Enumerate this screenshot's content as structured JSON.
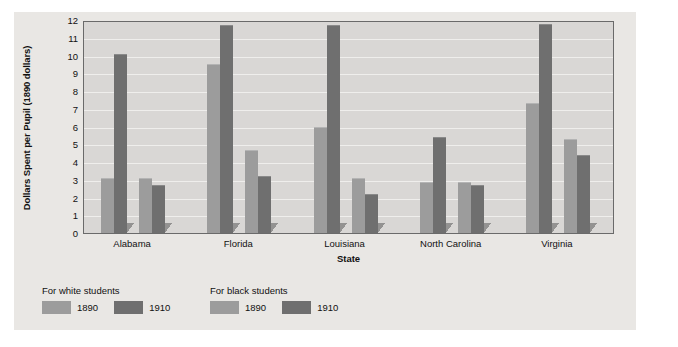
{
  "chart_data": {
    "type": "bar",
    "title": "",
    "xlabel": "State",
    "ylabel": "Dollars Spent per Pupil (1890 dollars)",
    "categories": [
      "Alabama",
      "Florida",
      "Louisiana",
      "North Carolina",
      "Virginia"
    ],
    "ylim": [
      0,
      12
    ],
    "yticks": [
      0,
      1,
      2,
      3,
      4,
      5,
      6,
      7,
      8,
      9,
      10,
      11,
      12
    ],
    "ytick_labels": [
      "0",
      "1",
      "2",
      "3",
      "4",
      "5",
      "6",
      "7",
      "8",
      "9",
      "10",
      "11",
      "12"
    ],
    "grid": true,
    "legend_position": "below-left",
    "series": [
      {
        "name": "For white students 1890",
        "group": "For white students",
        "year": "1890",
        "color": "#9c9c9c",
        "values": [
          3.1,
          9.5,
          6.0,
          2.9,
          7.3
        ]
      },
      {
        "name": "For white students 1910",
        "group": "For white students",
        "year": "1910",
        "color": "#6f6f6f",
        "values": [
          10.1,
          11.7,
          11.7,
          5.4,
          11.8
        ]
      },
      {
        "name": "For black students 1890",
        "group": "For black students",
        "year": "1890",
        "color": "#9c9c9c",
        "values": [
          3.1,
          4.7,
          3.1,
          2.9,
          5.3
        ]
      },
      {
        "name": "For black students 1910",
        "group": "For black students",
        "year": "1910",
        "color": "#6f6f6f",
        "values": [
          2.7,
          3.2,
          2.2,
          2.7,
          4.4
        ]
      }
    ]
  },
  "legend": {
    "groups": [
      {
        "title": "For white students",
        "items": [
          {
            "label": "1890",
            "swatch": "light"
          },
          {
            "label": "1910",
            "swatch": "dark"
          }
        ]
      },
      {
        "title": "For black students",
        "items": [
          {
            "label": "1890",
            "swatch": "light"
          },
          {
            "label": "1910",
            "swatch": "dark"
          }
        ]
      }
    ]
  },
  "colors": {
    "page_background": "#ffffff",
    "card_background": "#e9e7e4",
    "plot_background": "#d9d7d5",
    "plot_border": "#6a6a6a",
    "gridline": "#efeeec",
    "bar_light": "#9c9c9c",
    "bar_dark": "#6f6f6f",
    "text": "#111111"
  }
}
